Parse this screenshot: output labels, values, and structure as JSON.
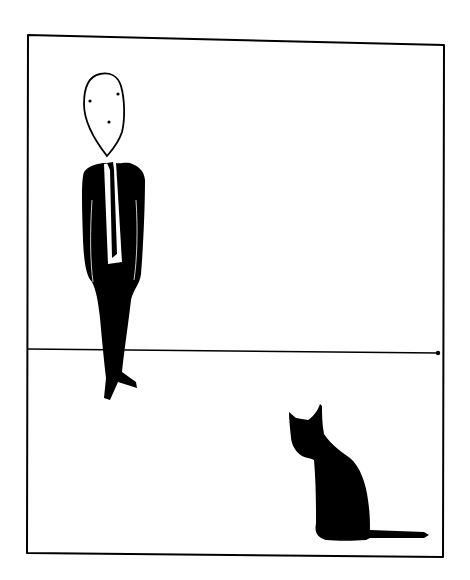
{
  "illustration": {
    "description": "Minimalist ink drawing: a man in a black suit and white tie stands left, a black cat sits lower right, inside a hand-drawn rectangular frame with a horizon line",
    "colors": {
      "background": "#ffffff",
      "ink": "#000000"
    },
    "frame": {
      "top_left": [
        28,
        35
      ],
      "top_right": [
        444,
        45
      ],
      "bottom_right": [
        443,
        557
      ],
      "bottom_left": [
        27,
        553
      ]
    },
    "horizon": {
      "y_left": 349,
      "y_right": 353
    },
    "elements": [
      "man-in-suit",
      "cat-silhouette"
    ]
  }
}
